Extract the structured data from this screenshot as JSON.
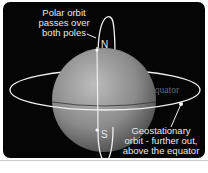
{
  "diagram": {
    "polar_label": [
      "Polar orbit",
      "passes over",
      "both poles"
    ],
    "north": "N",
    "south": "S",
    "equator": "Equator",
    "geo_label": [
      "Geostationary",
      "orbit - further out,",
      "above the equator"
    ],
    "colors": {
      "background": "#050505",
      "orbit": "#f0f0f0",
      "earth": "#8a8a8a"
    }
  }
}
